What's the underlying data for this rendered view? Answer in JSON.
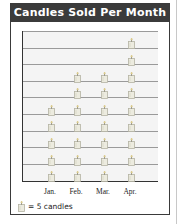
{
  "chart": {
    "title": "Candles Sold Per Month",
    "legend_text": "= 5 candles",
    "icon": "candle-icon"
  },
  "chart_data": {
    "type": "pictograph",
    "title": "Candles Sold Per Month",
    "categories": [
      "Jan.",
      "Feb.",
      "Mar.",
      "Apr."
    ],
    "icon_counts": [
      5,
      7,
      7,
      9
    ],
    "values": [
      25,
      35,
      35,
      45
    ],
    "unit_per_icon": 5,
    "legend": "= 5 candles",
    "grid_rows": 9,
    "xlabel": "",
    "ylabel": ""
  }
}
